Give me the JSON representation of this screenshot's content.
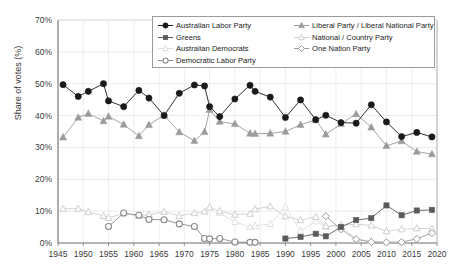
{
  "chart_data": {
    "type": "line",
    "title": "",
    "xlabel": "",
    "ylabel": "Share of votes (%)",
    "xlim": [
      1945,
      2020
    ],
    "ylim": [
      0,
      70
    ],
    "yticks": [
      0,
      10,
      20,
      30,
      40,
      50,
      60,
      70
    ],
    "ytick_labels": [
      "0%",
      "10%",
      "20%",
      "30%",
      "40%",
      "50%",
      "60%",
      "70%"
    ],
    "xticks": [
      1945,
      1950,
      1955,
      1960,
      1965,
      1970,
      1975,
      1980,
      1985,
      1990,
      1995,
      2000,
      2005,
      2010,
      2015,
      2020
    ],
    "xtick_labels": [
      "1945",
      "1950",
      "1955",
      "1960",
      "1965",
      "1970",
      "1975",
      "1980",
      "1985",
      "1990",
      "1995",
      "2000",
      "2005",
      "2010",
      "2015",
      "2020"
    ],
    "grid": true,
    "legend_position": "top-center",
    "series": [
      {
        "name": "Australian Labor Party",
        "color": "#1a1a1a",
        "marker": "circle-filled",
        "x": [
          1946,
          1949,
          1951,
          1954,
          1955,
          1958,
          1961,
          1963,
          1966,
          1969,
          1972,
          1974,
          1975,
          1977,
          1980,
          1983,
          1984,
          1987,
          1990,
          1993,
          1996,
          1998,
          2001,
          2004,
          2007,
          2010,
          2013,
          2016,
          2019
        ],
        "values": [
          49.7,
          46.0,
          47.6,
          50.0,
          44.6,
          42.8,
          47.9,
          45.5,
          40.0,
          47.0,
          49.6,
          49.3,
          42.8,
          39.7,
          45.2,
          49.5,
          47.6,
          45.8,
          39.4,
          44.9,
          38.7,
          40.1,
          37.8,
          37.6,
          43.4,
          38.0,
          33.4,
          34.7,
          33.3
        ]
      },
      {
        "name": "Liberal Party / Liberal National Party",
        "color": "#9b9b9b",
        "marker": "triangle-filled",
        "x": [
          1946,
          1949,
          1951,
          1954,
          1955,
          1958,
          1961,
          1963,
          1966,
          1969,
          1972,
          1974,
          1975,
          1977,
          1980,
          1983,
          1984,
          1987,
          1990,
          1993,
          1996,
          1998,
          2001,
          2004,
          2007,
          2010,
          2013,
          2016,
          2019
        ],
        "values": [
          33.2,
          39.4,
          40.6,
          38.3,
          39.7,
          37.2,
          33.6,
          37.1,
          40.1,
          34.8,
          32.1,
          34.9,
          41.8,
          38.1,
          37.4,
          34.4,
          34.3,
          34.4,
          35.0,
          37.1,
          38.7,
          34.1,
          37.4,
          40.5,
          36.3,
          30.5,
          32.0,
          28.7,
          27.9
        ]
      },
      {
        "name": "National / Country Party",
        "color": "#cfcfcf",
        "marker": "triangle-open",
        "x": [
          1946,
          1949,
          1951,
          1954,
          1955,
          1958,
          1961,
          1963,
          1966,
          1969,
          1972,
          1974,
          1975,
          1977,
          1980,
          1983,
          1984,
          1987,
          1990,
          1993,
          1996,
          1998,
          2001,
          2004,
          2007,
          2010,
          2013,
          2016,
          2019
        ],
        "values": [
          10.7,
          10.8,
          9.7,
          8.5,
          7.9,
          9.3,
          8.5,
          8.9,
          9.8,
          8.5,
          9.4,
          9.9,
          11.2,
          10.0,
          8.9,
          9.2,
          10.6,
          11.5,
          8.4,
          7.2,
          8.2,
          5.3,
          5.6,
          5.9,
          5.5,
          3.7,
          4.3,
          4.6,
          4.5
        ]
      },
      {
        "name": "Australian Democrats",
        "color": "#e0e0e0",
        "marker": "triangle-open",
        "x": [
          1977,
          1980,
          1983,
          1984,
          1987,
          1990,
          1993,
          1996,
          1998,
          2001,
          2004,
          2007,
          2010,
          2013
        ],
        "values": [
          9.4,
          6.6,
          5.0,
          5.4,
          6.0,
          11.3,
          3.8,
          6.8,
          5.1,
          5.4,
          1.2,
          0.7,
          0.2,
          0.1
        ]
      },
      {
        "name": "Democratic Labor Party",
        "color": "#8a8a8a",
        "marker": "circle-open",
        "x": [
          1955,
          1958,
          1961,
          1963,
          1966,
          1969,
          1972,
          1974,
          1975,
          1977,
          1980,
          1983,
          1984
        ],
        "values": [
          5.2,
          9.4,
          8.7,
          7.4,
          7.3,
          6.0,
          5.2,
          1.4,
          1.3,
          1.4,
          0.3,
          0.2,
          0.2
        ]
      },
      {
        "name": "Greens",
        "color": "#5a5a5a",
        "marker": "square-filled",
        "x": [
          1990,
          1993,
          1996,
          1998,
          2001,
          2004,
          2007,
          2010,
          2013,
          2016,
          2019
        ],
        "values": [
          1.4,
          1.9,
          2.9,
          2.1,
          5.0,
          7.2,
          7.8,
          11.8,
          8.7,
          10.2,
          10.4
        ]
      },
      {
        "name": "One Nation Party",
        "color": "#9b9b9b",
        "marker": "diamond-open",
        "x": [
          1998,
          2001,
          2004,
          2007,
          2010,
          2013,
          2016,
          2019
        ],
        "values": [
          8.4,
          4.3,
          1.2,
          0.3,
          0.2,
          0.3,
          1.3,
          3.1
        ]
      }
    ]
  },
  "legend": {
    "columns": [
      {
        "items": [
          {
            "label": "Australian Labor Party",
            "marker": "circle-filled",
            "color": "#1a1a1a"
          },
          {
            "label": "Greens",
            "marker": "square-filled",
            "color": "#5a5a5a"
          },
          {
            "label": "Australian Democrats",
            "marker": "triangle-open",
            "color": "#e0e0e0"
          },
          {
            "label": "Democratic Labor Party",
            "marker": "circle-open",
            "color": "#8a8a8a"
          }
        ]
      },
      {
        "items": [
          {
            "label": "Liberal Party / Liberal National Party",
            "marker": "triangle-filled",
            "color": "#9b9b9b"
          },
          {
            "label": "National / Country Party",
            "marker": "triangle-open",
            "color": "#cfcfcf"
          },
          {
            "label": "One Nation Party",
            "marker": "diamond-open",
            "color": "#9b9b9b"
          }
        ]
      }
    ]
  }
}
